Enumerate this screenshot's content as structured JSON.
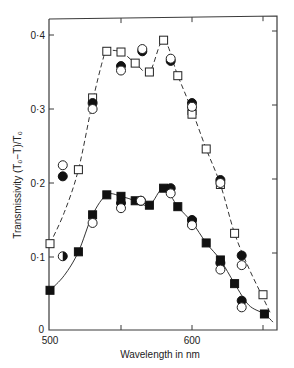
{
  "chart_data": {
    "type": "scatter",
    "title": "",
    "xlabel": "Wavelength in nm",
    "ylabel": "Transmissivity (T₀−T)/T₀",
    "xlim": [
      500,
      660
    ],
    "ylim": [
      0,
      0.42
    ],
    "x_ticks": [
      500,
      550,
      600,
      650
    ],
    "x_tick_labels": [
      "500",
      "",
      "600",
      ""
    ],
    "y_ticks": [
      0,
      0.1,
      0.2,
      0.3,
      0.4
    ],
    "y_tick_labels": [
      "0",
      "0·1",
      "0·2",
      "0·3",
      "0·4"
    ],
    "grid": false,
    "legend": null,
    "series": [
      {
        "name": "upper-open-squares",
        "marker": "open-square",
        "line": "dashed",
        "points": [
          [
            500,
            0.118
          ],
          [
            520,
            0.218
          ],
          [
            530,
            0.315
          ],
          [
            540,
            0.378
          ],
          [
            550,
            0.377
          ],
          [
            560,
            0.362
          ],
          [
            570,
            0.35
          ],
          [
            580,
            0.393
          ],
          [
            590,
            0.345
          ],
          [
            600,
            0.298
          ],
          [
            600,
            0.293
          ],
          [
            610,
            0.246
          ],
          [
            620,
            0.198
          ],
          [
            630,
            0.132
          ],
          [
            650,
            0.049
          ]
        ]
      },
      {
        "name": "upper-filled-circles",
        "marker": "filled-circle",
        "points": [
          [
            509,
            0.209
          ],
          [
            530,
            0.308
          ],
          [
            550,
            0.358
          ],
          [
            565,
            0.378
          ],
          [
            585,
            0.365
          ],
          [
            600,
            0.308
          ],
          [
            620,
            0.204
          ],
          [
            635,
            0.102
          ]
        ]
      },
      {
        "name": "upper-open-circles",
        "marker": "open-circle",
        "points": [
          [
            509,
            0.224
          ],
          [
            530,
            0.3
          ],
          [
            550,
            0.352
          ],
          [
            565,
            0.381
          ],
          [
            585,
            0.368
          ],
          [
            600,
            0.303
          ],
          [
            620,
            0.2
          ],
          [
            635,
            0.089
          ]
        ]
      },
      {
        "name": "lower-filled-squares",
        "marker": "filled-square",
        "line": "solid",
        "points": [
          [
            500,
            0.055
          ],
          [
            520,
            0.107
          ],
          [
            530,
            0.157
          ],
          [
            540,
            0.184
          ],
          [
            550,
            0.182
          ],
          [
            560,
            0.176
          ],
          [
            570,
            0.17
          ],
          [
            580,
            0.193
          ],
          [
            590,
            0.168
          ],
          [
            600,
            0.147
          ],
          [
            610,
            0.119
          ],
          [
            620,
            0.096
          ],
          [
            630,
            0.064
          ],
          [
            651,
            0.023
          ]
        ]
      },
      {
        "name": "lower-filled-circles",
        "marker": "filled-circle",
        "points": [
          [
            550,
            0.173
          ],
          [
            564,
            0.176
          ],
          [
            585,
            0.193
          ],
          [
            600,
            0.15
          ],
          [
            620,
            0.092
          ],
          [
            635,
            0.041
          ]
        ]
      },
      {
        "name": "lower-open-circles",
        "marker": "open-circle",
        "points": [
          [
            530,
            0.146
          ],
          [
            550,
            0.166
          ],
          [
            564,
            0.176
          ],
          [
            585,
            0.186
          ],
          [
            600,
            0.143
          ],
          [
            620,
            0.083
          ],
          [
            635,
            0.032
          ]
        ]
      },
      {
        "name": "half-filled-circle",
        "marker": "half-filled-circle",
        "points": [
          [
            509,
            0.101
          ]
        ]
      }
    ],
    "curves": {
      "upper_dashed": [
        [
          500,
          0.118
        ],
        [
          510,
          0.16
        ],
        [
          520,
          0.218
        ],
        [
          530,
          0.31
        ],
        [
          537,
          0.365
        ],
        [
          540,
          0.378
        ],
        [
          550,
          0.377
        ],
        [
          560,
          0.362
        ],
        [
          570,
          0.35
        ],
        [
          580,
          0.393
        ],
        [
          590,
          0.345
        ],
        [
          600,
          0.298
        ],
        [
          610,
          0.246
        ],
        [
          620,
          0.198
        ],
        [
          630,
          0.132
        ],
        [
          640,
          0.085
        ],
        [
          650,
          0.045
        ],
        [
          655,
          0.025
        ]
      ],
      "lower_solid": [
        [
          500,
          0.055
        ],
        [
          510,
          0.075
        ],
        [
          520,
          0.107
        ],
        [
          530,
          0.157
        ],
        [
          540,
          0.184
        ],
        [
          550,
          0.182
        ],
        [
          560,
          0.176
        ],
        [
          570,
          0.17
        ],
        [
          580,
          0.193
        ],
        [
          590,
          0.168
        ],
        [
          600,
          0.147
        ],
        [
          610,
          0.119
        ],
        [
          620,
          0.096
        ],
        [
          630,
          0.064
        ],
        [
          640,
          0.035
        ],
        [
          651,
          0.023
        ],
        [
          657,
          0.012
        ]
      ]
    }
  }
}
